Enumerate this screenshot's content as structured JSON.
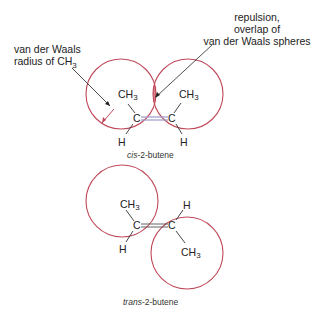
{
  "annotations": {
    "vdw_radius": {
      "line1": "van der Waals",
      "line2": "radius of CH",
      "sub": "3"
    },
    "repulsion": {
      "line1": "repulsion,",
      "line2": "overlap of",
      "line3": "van der Waals spheres"
    }
  },
  "cis": {
    "caption_italic": "cis",
    "caption_rest": "-2-butene",
    "atoms": {
      "ch3_left": "CH",
      "ch3_right": "CH",
      "sub": "3",
      "c_left": "C",
      "c_right": "C",
      "h_left": "H",
      "h_right": "H"
    }
  },
  "trans": {
    "caption_italic": "trans",
    "caption_rest": "-2-butene",
    "atoms": {
      "ch3_top": "CH",
      "ch3_bottom": "CH",
      "sub": "3",
      "c_left": "C",
      "c_right": "C",
      "h_top": "H",
      "h_bottom": "H"
    }
  },
  "colors": {
    "sphere": "#c0485a",
    "overlap_fill": "#d9808c",
    "bond_highlight": "#9a9ac8",
    "text": "#222222"
  }
}
